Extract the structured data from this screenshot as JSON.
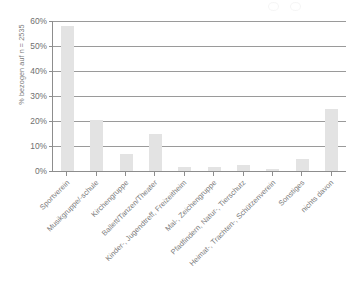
{
  "chart_data": {
    "type": "bar",
    "title": "",
    "xlabel": "",
    "ylabel": "% bezogen auf n = 2535",
    "ylim": [
      0,
      60
    ],
    "ytick_labels": [
      "0%",
      "10%",
      "20%",
      "30%",
      "40%",
      "50%",
      "60%"
    ],
    "ytick_values": [
      0,
      10,
      20,
      30,
      40,
      50,
      60
    ],
    "grid": true,
    "legend": "none",
    "bar_color": "#e3e3e3",
    "axis_color": "#8d8d8d",
    "categories": [
      "Sportverein",
      "Musikgruppe/-schule",
      "Kirchengruppe",
      "Ballett/Tanzen/Theater",
      "Kinder-, Jugendtreff, Freizeitheim",
      "Mal-, Zeichengruppe",
      "Pfadfindern, Natur-, Tierschutz",
      "Heimat-, Trachten-, Schützenverein",
      "Sonstiges",
      "nichts davon"
    ],
    "values": [
      58,
      20.5,
      7,
      15,
      1.5,
      1.5,
      2.5,
      0.8,
      5,
      25
    ]
  }
}
